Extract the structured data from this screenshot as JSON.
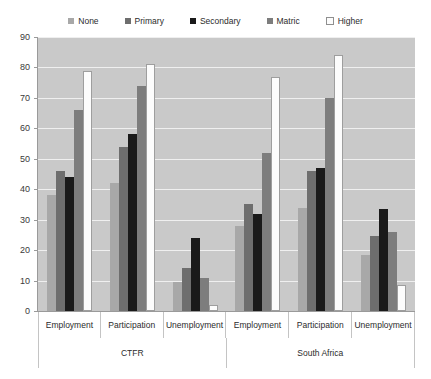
{
  "chart_data": {
    "type": "bar",
    "title": "",
    "xlabel": "",
    "ylabel": "",
    "ylim": [
      0,
      90
    ],
    "ytick_step": 10,
    "yticks": [
      0,
      10,
      20,
      30,
      40,
      50,
      60,
      70,
      80,
      90
    ],
    "grid": true,
    "legend_position": "top",
    "grouping": "grouped-bar, two-level category axis",
    "groups": [
      {
        "label": "CTFR",
        "categories": [
          "Employment",
          "Participation",
          "Unemployment"
        ]
      },
      {
        "label": "South Africa",
        "categories": [
          "Employment",
          "Participation",
          "Unemployment"
        ]
      }
    ],
    "categories": [
      "CTFR - Employment",
      "CTFR - Participation",
      "CTFR - Unemployment",
      "South Africa - Employment",
      "South Africa - Participation",
      "South Africa - Unemployment"
    ],
    "series": [
      {
        "name": "None",
        "color": "#a8a8a8",
        "values": [
          38,
          42,
          9.5,
          28,
          34,
          18.5
        ]
      },
      {
        "name": "Primary",
        "color": "#6e6e6e",
        "values": [
          46,
          54,
          14,
          35,
          46,
          24.5
        ]
      },
      {
        "name": "Secondary",
        "color": "#1a1a1a",
        "values": [
          44,
          58,
          24,
          32,
          47,
          33.5
        ]
      },
      {
        "name": "Matric",
        "color": "#7d7d7d",
        "values": [
          66,
          74,
          11,
          52,
          70,
          26
        ]
      },
      {
        "name": "Higher",
        "color": "#fcfcfc",
        "values": [
          79,
          81,
          2,
          77,
          84,
          8.5
        ]
      }
    ],
    "plot_background": "#c9c9c9",
    "gridline_color": "#efefef"
  },
  "legend": {
    "entries": [
      {
        "label": "None"
      },
      {
        "label": "Primary"
      },
      {
        "label": "Secondary"
      },
      {
        "label": "Matric"
      },
      {
        "label": "Higher"
      }
    ]
  },
  "y_axis": {
    "labels": [
      "90",
      "80",
      "70",
      "60",
      "50",
      "40",
      "30",
      "20",
      "10",
      "0"
    ]
  },
  "x_axis": {
    "category_labels": [
      "Employment",
      "Participation",
      "Unemployment",
      "Employment",
      "Participation",
      "Unemployment"
    ],
    "group_labels": [
      "CTFR",
      "South Africa"
    ]
  }
}
